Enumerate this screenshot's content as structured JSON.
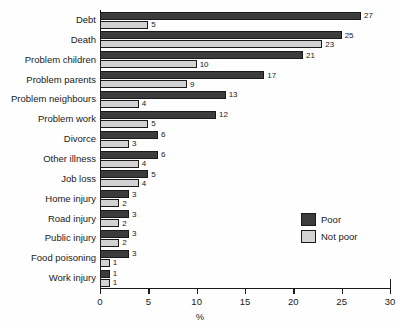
{
  "chart_data": {
    "type": "bar",
    "orientation": "horizontal",
    "grouped": true,
    "title": "",
    "subtitle": "",
    "xlabel": "%",
    "ylabel": "",
    "xlim": [
      0,
      30
    ],
    "xticks": [
      0,
      5,
      10,
      15,
      20,
      25,
      30
    ],
    "grid": false,
    "legend_position": "inside-right",
    "categories": [
      "Debt",
      "Death",
      "Problem children",
      "Problem parents",
      "Problem neighbours",
      "Problem work",
      "Divorce",
      "Other illness",
      "Job loss",
      "Home injury",
      "Road injury",
      "Public injury",
      "Food poisoning",
      "Work injury"
    ],
    "series": [
      {
        "name": "Poor",
        "color": "#3c3c3c",
        "values": [
          27,
          25,
          21,
          17,
          13,
          12,
          6,
          6,
          5,
          3,
          3,
          3,
          3,
          1
        ]
      },
      {
        "name": "Not poor",
        "color": "#d2d2d2",
        "values": [
          5,
          23,
          10,
          9,
          4,
          5,
          3,
          4,
          4,
          2,
          2,
          2,
          1,
          1
        ]
      }
    ],
    "data_labels": {
      "Poor": [
        "27",
        "25",
        "21",
        "17",
        "13",
        "12",
        "6",
        "6",
        "5",
        "3",
        "3",
        "3",
        "3",
        "1"
      ],
      "Not poor": [
        "5",
        "23",
        "10",
        "9",
        "4",
        "5",
        "3",
        "4",
        "4",
        "2",
        "2",
        "2",
        "1",
        "1"
      ]
    }
  },
  "legend": {
    "items": [
      {
        "label": "Poor",
        "color": "#3c3c3c"
      },
      {
        "label": "Not poor",
        "color": "#d2d2d2"
      }
    ]
  },
  "axis": {
    "x_title": "%",
    "x_tick_labels": [
      "0",
      "5",
      "10",
      "15",
      "20",
      "25",
      "30"
    ]
  }
}
